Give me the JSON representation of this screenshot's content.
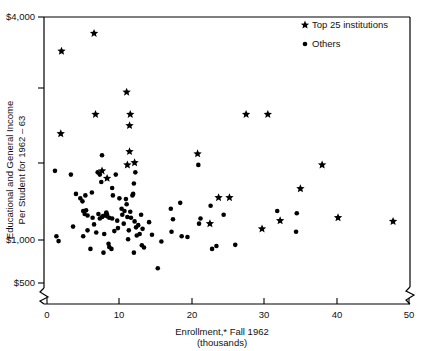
{
  "chart_data": {
    "type": "scatter",
    "title": "",
    "xlabel": "Enrollment,* Fall 1962",
    "xlabel_sub": "(thousands)",
    "ylabel_line1": "Educational and General Income",
    "ylabel_line2": "Per Student for 1962 – 63",
    "xlim": [
      0,
      50
    ],
    "ylim": [
      500,
      4000
    ],
    "xticks": [
      0,
      10,
      20,
      30,
      40,
      50
    ],
    "xtick_labels": [
      "0",
      "10",
      "20",
      "30",
      "40",
      "50"
    ],
    "yticks": [
      500,
      1000,
      2000,
      3000,
      4000
    ],
    "ytick_labels": [
      "$500",
      "$1,000",
      "",
      "",
      "$4,000"
    ],
    "grid": false,
    "axis_break_x": true,
    "axis_break_y": true,
    "legend_position": "top-right",
    "series": [
      {
        "name": "Top 25 institutions",
        "marker": "star",
        "color": "#000000",
        "points": [
          [
            6.5,
            3780
          ],
          [
            2.0,
            3540
          ],
          [
            11.0,
            2990
          ],
          [
            11.5,
            2690
          ],
          [
            11.4,
            2540
          ],
          [
            6.7,
            2690
          ],
          [
            1.9,
            2430
          ],
          [
            11.4,
            2190
          ],
          [
            20.8,
            2160
          ],
          [
            27.5,
            2690
          ],
          [
            30.5,
            2690
          ],
          [
            7.6,
            1930
          ],
          [
            11.1,
            2010
          ],
          [
            12.1,
            2040
          ],
          [
            38.0,
            2010
          ],
          [
            35.0,
            1690
          ],
          [
            23.7,
            1570
          ],
          [
            25.2,
            1570
          ],
          [
            8.3,
            1830
          ],
          [
            29.7,
            1150
          ],
          [
            32.2,
            1260
          ],
          [
            40.2,
            1300
          ],
          [
            47.8,
            1250
          ],
          [
            8.0,
            1330
          ],
          [
            22.5,
            1220
          ]
        ]
      },
      {
        "name": "Others",
        "marker": "dot",
        "color": "#000000",
        "points": [
          [
            1.1,
            1930
          ],
          [
            1.3,
            1050
          ],
          [
            1.6,
            985
          ],
          [
            3.3,
            1880
          ],
          [
            4.0,
            1620
          ],
          [
            4.6,
            1560
          ],
          [
            4.9,
            1520
          ],
          [
            5.0,
            1390
          ],
          [
            5.2,
            1350
          ],
          [
            5.4,
            1400
          ],
          [
            5.6,
            1330
          ],
          [
            5.3,
            1600
          ],
          [
            5.0,
            1050
          ],
          [
            5.6,
            1130
          ],
          [
            6.0,
            880
          ],
          [
            6.2,
            1640
          ],
          [
            6.3,
            1300
          ],
          [
            6.5,
            1210
          ],
          [
            6.8,
            1100
          ],
          [
            7.0,
            1910
          ],
          [
            7.3,
            1880
          ],
          [
            7.6,
            2140
          ],
          [
            7.5,
            1780
          ],
          [
            7.1,
            1350
          ],
          [
            7.3,
            1290
          ],
          [
            7.6,
            1310
          ],
          [
            7.9,
            1080
          ],
          [
            7.8,
            830
          ],
          [
            8.2,
            1370
          ],
          [
            8.3,
            1340
          ],
          [
            8.6,
            1300
          ],
          [
            8.5,
            950
          ],
          [
            8.6,
            905
          ],
          [
            8.9,
            880
          ],
          [
            9.0,
            1290
          ],
          [
            9.1,
            1600
          ],
          [
            9.3,
            1120
          ],
          [
            9.0,
            1700
          ],
          [
            9.5,
            1880
          ],
          [
            9.7,
            1260
          ],
          [
            9.8,
            1160
          ],
          [
            10.0,
            1560
          ],
          [
            10.3,
            1420
          ],
          [
            10.4,
            1340
          ],
          [
            10.6,
            1220
          ],
          [
            10.7,
            1390
          ],
          [
            10.9,
            1550
          ],
          [
            11.0,
            1480
          ],
          [
            11.1,
            1310
          ],
          [
            11.3,
            1130
          ],
          [
            11.2,
            1010
          ],
          [
            11.5,
            1380
          ],
          [
            11.6,
            1300
          ],
          [
            11.8,
            1600
          ],
          [
            11.9,
            1620
          ],
          [
            12.0,
            1760
          ],
          [
            12.2,
            1910
          ],
          [
            12.1,
            1250
          ],
          [
            12.3,
            1170
          ],
          [
            12.4,
            1060
          ],
          [
            12.0,
            830
          ],
          [
            12.6,
            1200
          ],
          [
            12.8,
            1080
          ],
          [
            13.0,
            1340
          ],
          [
            13.2,
            1150
          ],
          [
            13.1,
            930
          ],
          [
            13.4,
            900
          ],
          [
            14.1,
            1240
          ],
          [
            14.5,
            1070
          ],
          [
            15.3,
            620
          ],
          [
            15.8,
            980
          ],
          [
            17.1,
            1420
          ],
          [
            17.2,
            1110
          ],
          [
            17.4,
            1280
          ],
          [
            18.4,
            1500
          ],
          [
            18.6,
            1050
          ],
          [
            19.4,
            1040
          ],
          [
            20.9,
            2010
          ],
          [
            21.2,
            1290
          ],
          [
            21.0,
            1220
          ],
          [
            22.6,
            1460
          ],
          [
            22.8,
            880
          ],
          [
            23.4,
            920
          ],
          [
            24.4,
            1340
          ],
          [
            26.0,
            935
          ],
          [
            31.8,
            1390
          ],
          [
            34.5,
            1360
          ],
          [
            34.4,
            1110
          ],
          [
            3.6,
            1180
          ]
        ]
      }
    ],
    "annotations": []
  },
  "legend": {
    "items": [
      {
        "label": "Top 25 institutions",
        "marker": "star"
      },
      {
        "label": "Others",
        "marker": "dot"
      }
    ]
  }
}
